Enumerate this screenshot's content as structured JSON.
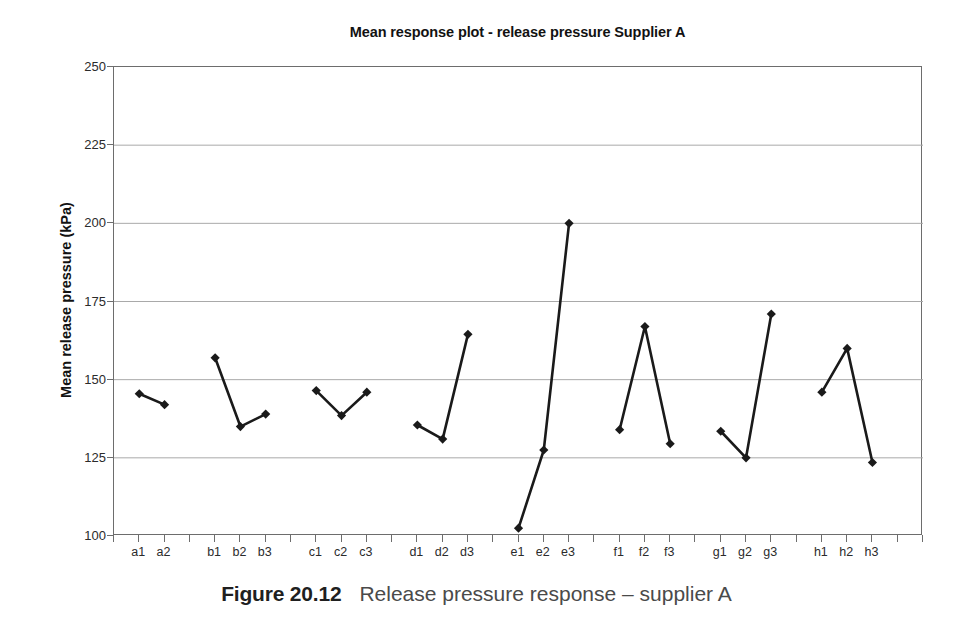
{
  "figure": {
    "caption_label": "Figure 20.12",
    "caption_text": "Release pressure response – supplier A"
  },
  "chart_data": {
    "type": "line",
    "title": "Mean response plot - release pressure Supplier A",
    "xlabel": "",
    "ylabel": "Mean release pressure (kPa)",
    "ylim": [
      100,
      250
    ],
    "ytick_values": [
      100,
      125,
      150,
      175,
      200,
      225,
      250
    ],
    "ytick_labels": [
      "100",
      "125",
      "150",
      "175",
      "200",
      "225",
      "250"
    ],
    "grid": "horizontal",
    "legend": "none",
    "marker": "diamond",
    "line_color": "#1a1a1a",
    "marker_color": "#1a1a1a",
    "grid_color": "#a9a9a9",
    "axis_color": "#6d6d6d",
    "categories": [
      "a1",
      "a2",
      "b1",
      "b2",
      "b3",
      "c1",
      "c2",
      "c3",
      "d1",
      "d2",
      "d3",
      "e1",
      "e2",
      "e3",
      "f1",
      "f2",
      "f3",
      "g1",
      "g2",
      "g3",
      "h1",
      "h2",
      "h3"
    ],
    "values": [
      145.5,
      142.0,
      157.0,
      135.0,
      139.0,
      146.5,
      138.5,
      146.0,
      135.5,
      131.0,
      164.5,
      102.5,
      127.5,
      200.0,
      134.0,
      167.0,
      129.5,
      133.5,
      125.0,
      171.0,
      146.0,
      160.0,
      123.5
    ],
    "slot_positions": [
      1,
      2,
      4,
      5,
      6,
      8,
      9,
      10,
      12,
      13,
      14,
      16,
      17,
      18,
      20,
      21,
      22,
      24,
      25,
      26,
      28,
      29,
      30
    ],
    "slot_count": 32,
    "groups": [
      {
        "name": "a",
        "categories": [
          "a1",
          "a2"
        ],
        "values": [
          145.5,
          142.0
        ]
      },
      {
        "name": "b",
        "categories": [
          "b1",
          "b2",
          "b3"
        ],
        "values": [
          157.0,
          135.0,
          139.0
        ]
      },
      {
        "name": "c",
        "categories": [
          "c1",
          "c2",
          "c3"
        ],
        "values": [
          146.5,
          138.5,
          146.0
        ]
      },
      {
        "name": "d",
        "categories": [
          "d1",
          "d2",
          "d3"
        ],
        "values": [
          135.5,
          131.0,
          164.5
        ]
      },
      {
        "name": "e",
        "categories": [
          "e1",
          "e2",
          "e3"
        ],
        "values": [
          102.5,
          127.5,
          200.0
        ]
      },
      {
        "name": "f",
        "categories": [
          "f1",
          "f2",
          "f3"
        ],
        "values": [
          134.0,
          167.0,
          129.5
        ]
      },
      {
        "name": "g",
        "categories": [
          "g1",
          "g2",
          "g3"
        ],
        "values": [
          133.5,
          125.0,
          171.0
        ]
      },
      {
        "name": "h",
        "categories": [
          "h1",
          "h2",
          "h3"
        ],
        "values": [
          146.0,
          160.0,
          123.5
        ]
      }
    ]
  }
}
